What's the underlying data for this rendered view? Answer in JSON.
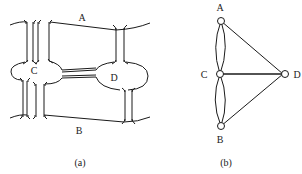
{
  "figure_a": {
    "caption": "(a)",
    "labels": {
      "A": "A",
      "B": "B",
      "C": "C",
      "D": "D"
    },
    "description": "Königsberg bridges: two river banks A and B, islands C and D, seven bridges"
  },
  "figure_b": {
    "caption": "(b)",
    "nodes": [
      {
        "id": "A",
        "label": "A"
      },
      {
        "id": "B",
        "label": "B"
      },
      {
        "id": "C",
        "label": "C"
      },
      {
        "id": "D",
        "label": "D"
      }
    ],
    "edges": [
      [
        "A",
        "C"
      ],
      [
        "A",
        "C"
      ],
      [
        "C",
        "B"
      ],
      [
        "C",
        "B"
      ],
      [
        "A",
        "D"
      ],
      [
        "C",
        "D"
      ],
      [
        "B",
        "D"
      ]
    ]
  },
  "colors": {
    "stroke": "#1a1a1a",
    "background": "#ffffff"
  }
}
